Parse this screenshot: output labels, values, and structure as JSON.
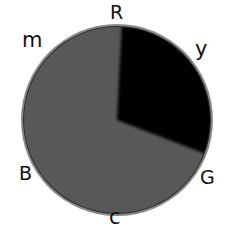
{
  "diagram": {
    "type": "hue-wheel",
    "colors": {
      "fill": "#585858",
      "wedge": "#030303",
      "ring": "#8a8a8a",
      "ring_inner": "#2a2a2a",
      "label": "#111111"
    },
    "wedge": {
      "start_deg": 3,
      "end_deg": 111
    },
    "labels": {
      "top": "R",
      "upper_left": "m",
      "upper_right": "y",
      "lower_left": "B",
      "lower_right": "G",
      "bottom": "c"
    }
  }
}
